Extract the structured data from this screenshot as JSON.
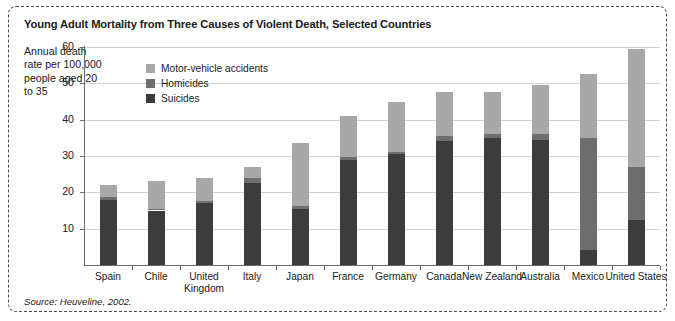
{
  "figure": {
    "title": "Young Adult Mortality from Three Causes of Violent Death, Selected Countries",
    "axis_caption": "Annual death rate per 100,000 people aged 20 to 35",
    "source": "Source: Heuveline, 2002."
  },
  "colors": {
    "motor_vehicle_accidents": "#a8a8a8",
    "homicides": "#6e6e6e",
    "suicides": "#3c3c3c",
    "gridline": "#d2d2d2",
    "axis": "#6b6b6b",
    "frame": "#4d4d4d",
    "text": "#1a1a1a"
  },
  "chart_data": {
    "type": "bar",
    "subtype": "stacked",
    "title": "Young Adult Mortality from Three Causes of Violent Death, Selected Countries",
    "xlabel": "",
    "ylabel": "Annual death rate per 100,000 people aged 20 to 35",
    "ylim": [
      0,
      60
    ],
    "yticks": [
      10,
      20,
      30,
      40,
      50,
      60
    ],
    "ytick_labels": [
      "10",
      "20",
      "30",
      "40",
      "50",
      "60"
    ],
    "grid": "horizontal",
    "legend_position": "inside-top-left",
    "categories": [
      "Spain",
      "Chile",
      "United Kingdom",
      "Italy",
      "Japan",
      "France",
      "Germany",
      "Canada",
      "New Zealand",
      "Australia",
      "Mexico",
      "United States"
    ],
    "series": [
      {
        "name": "Suicides",
        "color": "#3c3c3c",
        "values": [
          18.0,
          15.0,
          17.0,
          22.5,
          15.5,
          29.0,
          30.5,
          34.0,
          35.0,
          34.5,
          4.0,
          12.5
        ]
      },
      {
        "name": "Homicides",
        "color": "#6e6e6e",
        "values": [
          0.7,
          0.5,
          0.5,
          1.5,
          0.7,
          0.7,
          0.7,
          1.5,
          1.0,
          1.5,
          31.0,
          14.5
        ]
      },
      {
        "name": "Motor-vehicle accidents",
        "color": "#a8a8a8",
        "values": [
          3.3,
          7.5,
          6.5,
          3.0,
          17.3,
          11.3,
          13.8,
          12.0,
          11.5,
          13.5,
          17.5,
          32.5
        ]
      }
    ],
    "totals": [
      22.0,
      23.0,
      24.0,
      27.0,
      33.5,
      41.0,
      45.0,
      47.5,
      47.5,
      49.5,
      52.5,
      59.5
    ]
  },
  "legend": {
    "items": [
      {
        "label": "Motor-vehicle accidents",
        "color": "#a8a8a8"
      },
      {
        "label": "Homicides",
        "color": "#6e6e6e"
      },
      {
        "label": "Suicides",
        "color": "#3c3c3c"
      }
    ]
  }
}
